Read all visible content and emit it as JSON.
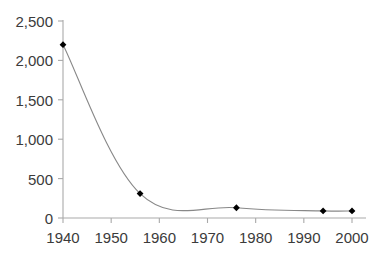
{
  "chart_data": {
    "type": "line",
    "title": "",
    "subtitle": "",
    "xlabel": "",
    "ylabel": "",
    "xlim": [
      1940,
      2000
    ],
    "ylim": [
      0,
      2500
    ],
    "grid": false,
    "legend": null,
    "smoothed": true,
    "marker": "diamond",
    "series": [
      {
        "name": "",
        "points": [
          {
            "x": 1940,
            "y": 2200
          },
          {
            "x": 1956,
            "y": 310
          },
          {
            "x": 1976,
            "y": 130
          },
          {
            "x": 1994,
            "y": 90
          },
          {
            "x": 2000,
            "y": 90
          }
        ]
      }
    ],
    "x_ticks": [
      1940,
      1950,
      1960,
      1970,
      1980,
      1990,
      2000
    ],
    "x_tick_labels": [
      "1940",
      "1950",
      "1960",
      "1970",
      "1980",
      "1990",
      "2000"
    ],
    "y_ticks": [
      0,
      500,
      1000,
      1500,
      2000,
      2500
    ],
    "y_tick_labels": [
      "0",
      "500",
      "1,000",
      "1,500",
      "2,000",
      "2,500"
    ]
  },
  "style": {
    "line_color": "#888888",
    "marker_color": "#000000",
    "axis_color": "#a9a9a9",
    "tick_color": "#a9a9a9",
    "text_color": "#3b3b3b",
    "background": "#ffffff"
  }
}
